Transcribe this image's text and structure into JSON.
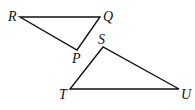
{
  "diagram": {
    "type": "geometry-triangles",
    "stroke_color": "#111111",
    "triangles": [
      {
        "name": "PQR",
        "vertices": [
          {
            "label": "R",
            "x": 20,
            "y": 17
          },
          {
            "label": "Q",
            "x": 100,
            "y": 17
          },
          {
            "label": "P",
            "x": 77,
            "y": 50
          }
        ]
      },
      {
        "name": "STU",
        "vertices": [
          {
            "label": "S",
            "x": 103,
            "y": 47
          },
          {
            "label": "T",
            "x": 70,
            "y": 89
          },
          {
            "label": "U",
            "x": 179,
            "y": 89
          }
        ]
      }
    ],
    "labels": {
      "R": "R",
      "Q": "Q",
      "P": "P",
      "S": "S",
      "T": "T",
      "U": "U"
    }
  }
}
